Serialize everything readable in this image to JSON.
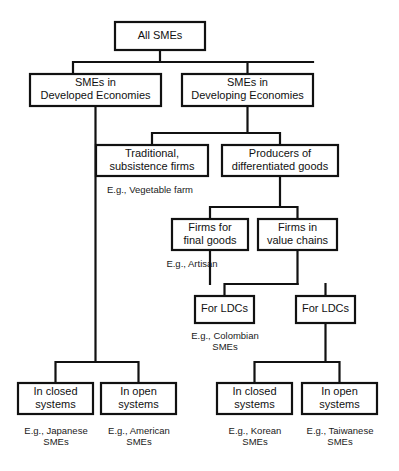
{
  "diagram": {
    "stroke_color": "#111111",
    "box_fill": "#ffffff",
    "background": "#ffffff",
    "nodes": [
      {
        "id": "all-smes",
        "label_line1": "All SMEs",
        "label_line2": "",
        "x": 115,
        "y": 22,
        "w": 90,
        "h": 28
      },
      {
        "id": "developed",
        "label_line1": "SMEs in",
        "label_line2": "Developed Economies",
        "x": 30,
        "y": 74,
        "w": 131,
        "h": 32
      },
      {
        "id": "developing",
        "label_line1": "SMEs in",
        "label_line2": "Developing Economies",
        "x": 182,
        "y": 74,
        "w": 131,
        "h": 32
      },
      {
        "id": "traditional",
        "label_line1": "Traditional,",
        "label_line2": "subsistence firms",
        "x": 96,
        "y": 145,
        "w": 112,
        "h": 31
      },
      {
        "id": "producers",
        "label_line1": "Producers of",
        "label_line2": "differentiated goods",
        "x": 222,
        "y": 145,
        "w": 116,
        "h": 31
      },
      {
        "id": "final-goods",
        "label_line1": "Firms for",
        "label_line2": "final goods",
        "x": 172,
        "y": 219,
        "w": 76,
        "h": 31
      },
      {
        "id": "value-chains",
        "label_line1": "Firms in",
        "label_line2": "value chains",
        "x": 258,
        "y": 219,
        "w": 79,
        "h": 31
      },
      {
        "id": "ldc-final",
        "label_line1": "For LDCs",
        "label_line2": "",
        "x": 195,
        "y": 296,
        "w": 59,
        "h": 27
      },
      {
        "id": "ldc-value",
        "label_line1": "For LDCs",
        "label_line2": "",
        "x": 296,
        "y": 296,
        "w": 59,
        "h": 27
      },
      {
        "id": "closed-developed",
        "label_line1": "In closed",
        "label_line2": "systems",
        "x": 18,
        "y": 383,
        "w": 75,
        "h": 31
      },
      {
        "id": "open-developed",
        "label_line1": "In open",
        "label_line2": "systems",
        "x": 101,
        "y": 383,
        "w": 75,
        "h": 31
      },
      {
        "id": "closed-ldc",
        "label_line1": "In closed",
        "label_line2": "systems",
        "x": 217,
        "y": 383,
        "w": 75,
        "h": 31
      },
      {
        "id": "open-ldc",
        "label_line1": "In open",
        "label_line2": "systems",
        "x": 302,
        "y": 383,
        "w": 75,
        "h": 31
      }
    ],
    "captions": [
      {
        "id": "caption-vegetable-farm",
        "line1": "E.g., Vegetable farm",
        "line2": "",
        "cx": 150,
        "y": 190
      },
      {
        "id": "caption-artisan",
        "line1": "E.g., Artisan",
        "line2": "",
        "cx": 192,
        "y": 264
      },
      {
        "id": "caption-colombian",
        "line1": "E.g., Colombian",
        "line2": "SMEs",
        "cx": 225,
        "y": 336
      },
      {
        "id": "caption-japanese",
        "line1": "E.g., Japanese",
        "line2": "SMEs",
        "cx": 56,
        "y": 431
      },
      {
        "id": "caption-american",
        "line1": "E.g., American",
        "line2": "SMEs",
        "cx": 139,
        "y": 431
      },
      {
        "id": "caption-korean",
        "line1": "E.g., Korean",
        "line2": "SMEs",
        "cx": 255,
        "y": 431
      },
      {
        "id": "caption-taiwanese",
        "line1": "E.g., Taiwanese",
        "line2": "SMEs",
        "cx": 340,
        "y": 431
      }
    ],
    "connectors": [
      {
        "id": "conn-all-to-row2",
        "d": "M 160 50 L 160 62 M 73 62 L 313 62 M 73 62 L 73 74 M 247.5 62 L 247.5 74"
      },
      {
        "id": "conn-developing-split",
        "d": "M 247.5 106 L 247.5 133 M 152 133 L 280 133 M 152 133 L 152 145 M 280 133 L 280 145"
      },
      {
        "id": "conn-producers-split",
        "d": "M 280 176 L 280 207 M 210 207 L 297.5 207 M 210 207 L 210 219 M 297.5 207 L 297.5 219"
      },
      {
        "id": "conn-final-to-ldc",
        "d": "M 210 250 L 210 284 M 224.5 284 L 297.5 284 M 224.5 284 L 224.5 296"
      },
      {
        "id": "conn-value-to-ldc",
        "d": "M 297.5 250 L 297.5 284 M 325.5 284 L 325.5 296"
      },
      {
        "id": "conn-developed-to-base",
        "d": "M 95.5 106 L 95.5 362 M 55.5 362 L 138.5 362 M 55.5 362 L 55.5 383 M 138.5 362 L 138.5 383"
      },
      {
        "id": "conn-ldc-value-to-base",
        "d": "M 325.5 323 L 325.5 362 M 254.5 362 L 339.5 362 M 254.5 362 L 254.5 383 M 339.5 362 L 339.5 383"
      }
    ]
  }
}
